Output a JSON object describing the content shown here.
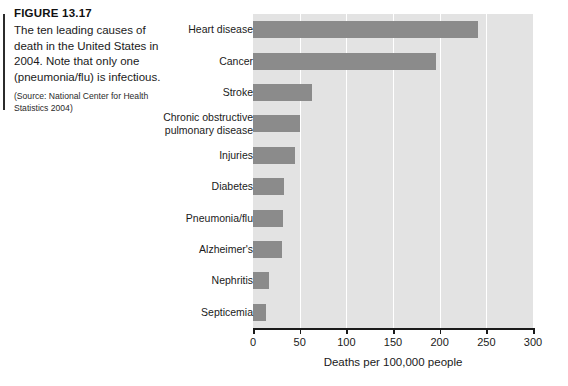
{
  "caption": {
    "figure_label": "FIGURE 13.17",
    "text": "The ten leading causes of death in the United States in 2004. Note that only one (pneumonia/flu) is infectious.",
    "source": "(Source: National Center for Health Statistics 2004)"
  },
  "colors": {
    "bar": "#8b8b8b",
    "plot_background": "#e3e3e3",
    "gridline": "#ffffff",
    "axis": "#1a1a1a",
    "text": "#1a1a1a"
  },
  "chart_data": {
    "type": "bar",
    "orientation": "horizontal",
    "title": "",
    "subtitle": "",
    "xlabel": "Deaths per 100,000 people",
    "ylabel": "",
    "xlim": [
      0,
      300
    ],
    "xticks": [
      0,
      50,
      100,
      150,
      200,
      250,
      300
    ],
    "xtick_labels": [
      "0",
      "50",
      "100",
      "150",
      "200",
      "250",
      "300"
    ],
    "grid": "vertical-white-gridlines",
    "legend": "none",
    "categories": [
      "Heart disease",
      "Cancer",
      "Stroke",
      "Chronic obstructive pulmonary disease",
      "Injuries",
      "Diabetes",
      "Pneumonia/flu",
      "Alzheimer's",
      "Nephritis",
      "Septicemia"
    ],
    "category_labels_display": [
      "Heart disease",
      "Cancer",
      "Stroke",
      "Chronic obstructive\npulmonary disease",
      "Injuries",
      "Diabetes",
      "Pneumonia/flu",
      "Alzheimer's",
      "Nephritis",
      "Septicemia"
    ],
    "values": [
      241,
      196,
      63,
      50,
      45,
      33,
      32,
      31,
      17,
      14
    ],
    "units": "deaths per 100,000 people"
  }
}
